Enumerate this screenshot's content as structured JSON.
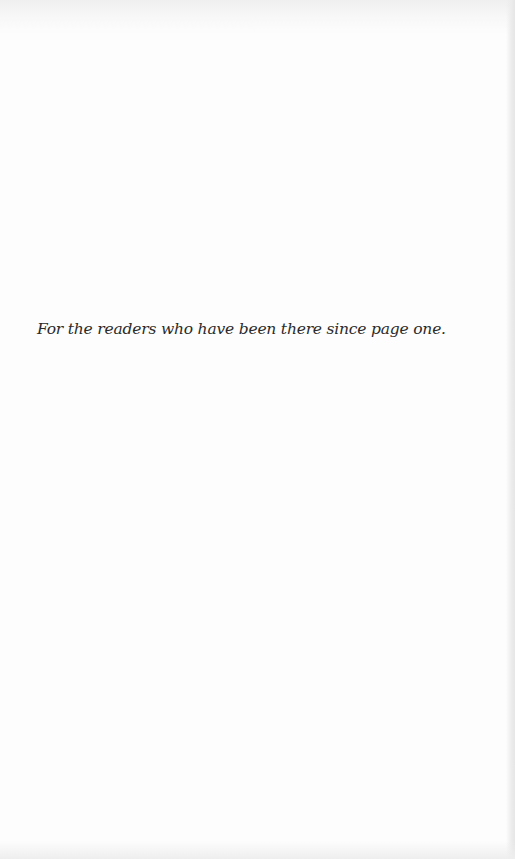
{
  "page": {
    "type": "dedication",
    "background_color": "#fdfdfd",
    "text_color": "#2b2b2b"
  },
  "dedication": {
    "text": "For the readers who have been there since page one."
  }
}
